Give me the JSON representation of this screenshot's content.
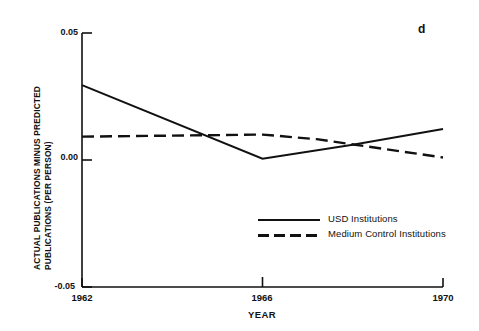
{
  "panel": {
    "label": "d"
  },
  "chart_data": {
    "type": "line",
    "title": "",
    "xlabel": "YEAR",
    "ylabel": "ACTUAL PUBLICATIONS MINUS PREDICTED PUBLICATIONS (PER PERSON)",
    "ylabel_line1": "ACTUAL PUBLICATIONS MINUS PREDICTED",
    "ylabel_line2": "PUBLICATIONS (PER PERSON)",
    "xlim": [
      1962,
      1970
    ],
    "ylim": [
      -0.05,
      0.05
    ],
    "xticks": [
      1962,
      1966,
      1970
    ],
    "xticklabels": [
      "1962",
      "1966",
      "1970"
    ],
    "yticks": [
      -0.05,
      0.0,
      0.05
    ],
    "yticklabels": [
      "-0.05",
      "0.00",
      "0.05"
    ],
    "grid": false,
    "legend_position": "center-right-inside",
    "series": [
      {
        "name": "USD Institutions",
        "style": "solid",
        "color": "#111111",
        "x": [
          1962,
          1966,
          1968,
          1970
        ],
        "values": [
          0.0295,
          0.0005,
          0.006,
          0.0122
        ]
      },
      {
        "name": "Medium Control Institutions",
        "style": "dashed",
        "color": "#111111",
        "x": [
          1962,
          1966,
          1967.2,
          1970
        ],
        "values": [
          0.0092,
          0.01,
          0.0082,
          0.001
        ]
      }
    ]
  },
  "legend": {
    "items": [
      {
        "label": "USD Institutions",
        "style": "solid"
      },
      {
        "label": "Medium Control Institutions",
        "style": "dashed"
      }
    ]
  },
  "axis": {
    "y_top_label": "0.05",
    "y_mid_label": "0.00",
    "y_bottom_label": "-0.05",
    "x_labels": [
      "1962",
      "1966",
      "1970"
    ],
    "x_title": "YEAR"
  },
  "colors": {
    "ink": "#111111",
    "background": "#ffffff"
  }
}
